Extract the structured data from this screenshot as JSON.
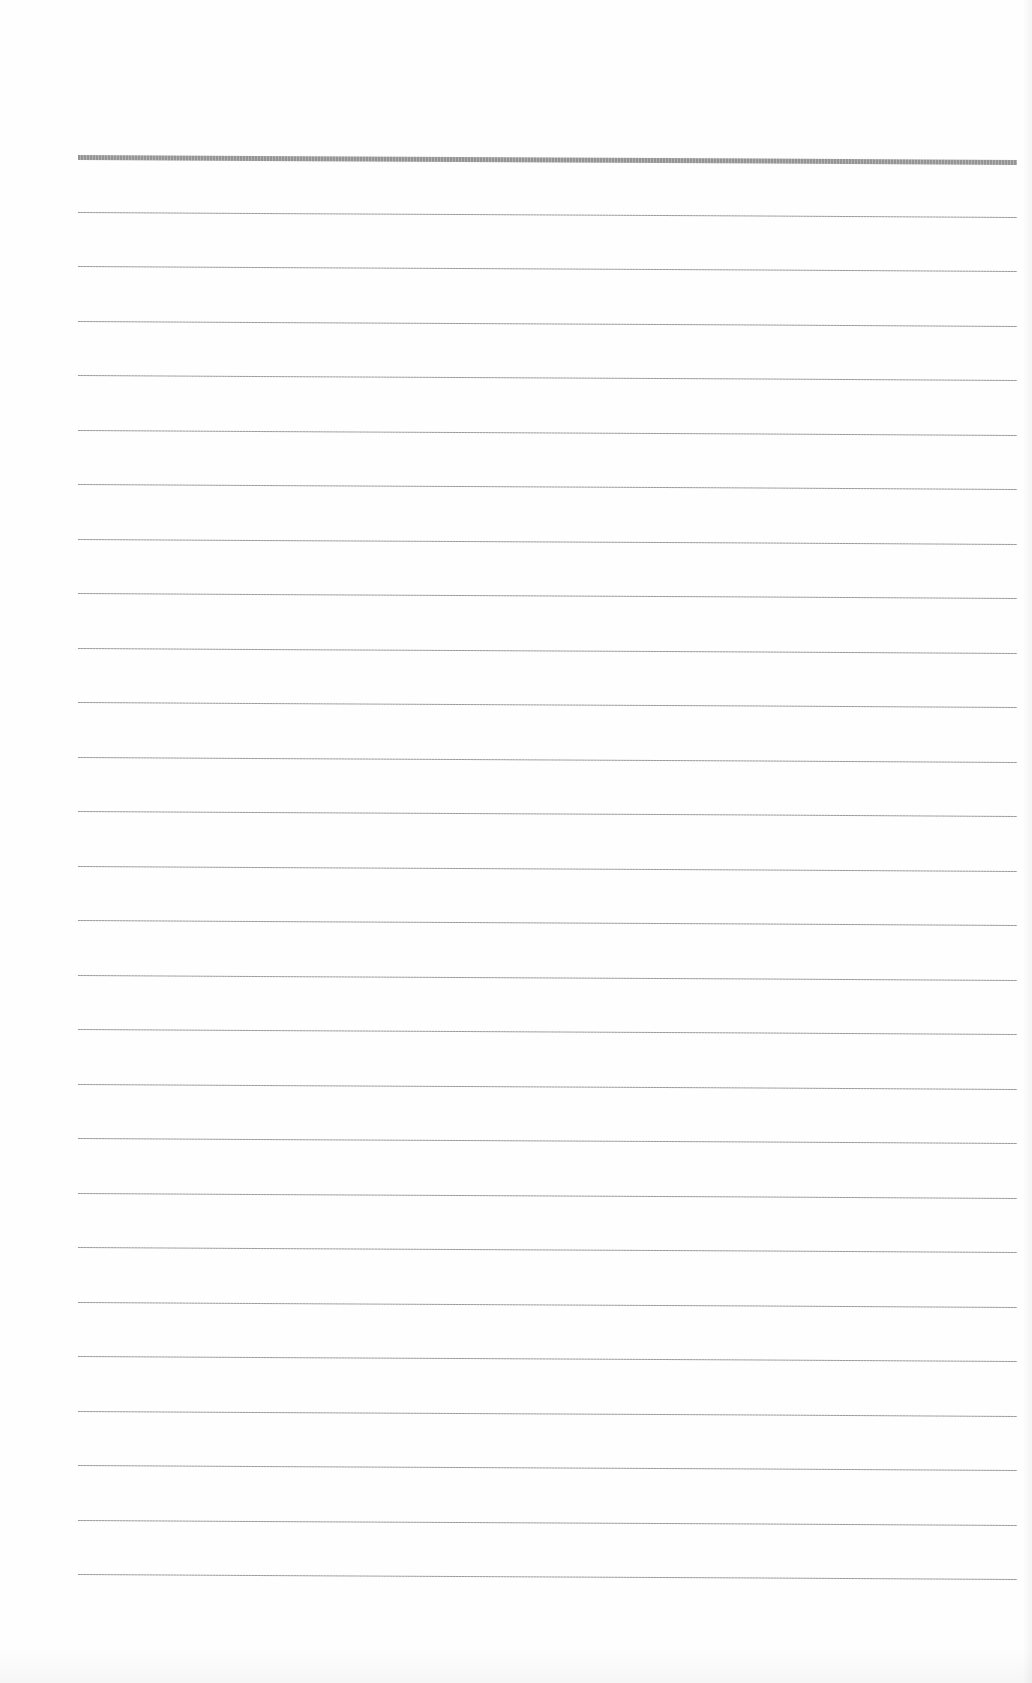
{
  "document": {
    "type": "lined-paper",
    "line_color": "#9a9a9a",
    "header_line_color": "#8f8f8f",
    "background": "#fefefe",
    "line_count": 27,
    "first_line_y": 157,
    "line_spacing": 54.5,
    "left_margin": 78,
    "right_margin_x": 1017
  },
  "lines": [
    {
      "index": 0,
      "thick": true
    },
    {
      "index": 1
    },
    {
      "index": 2
    },
    {
      "index": 3
    },
    {
      "index": 4
    },
    {
      "index": 5
    },
    {
      "index": 6
    },
    {
      "index": 7
    },
    {
      "index": 8
    },
    {
      "index": 9
    },
    {
      "index": 10
    },
    {
      "index": 11
    },
    {
      "index": 12
    },
    {
      "index": 13
    },
    {
      "index": 14
    },
    {
      "index": 15
    },
    {
      "index": 16
    },
    {
      "index": 17
    },
    {
      "index": 18
    },
    {
      "index": 19
    },
    {
      "index": 20
    },
    {
      "index": 21
    },
    {
      "index": 22
    },
    {
      "index": 23
    },
    {
      "index": 24
    },
    {
      "index": 25
    },
    {
      "index": 26
    }
  ]
}
